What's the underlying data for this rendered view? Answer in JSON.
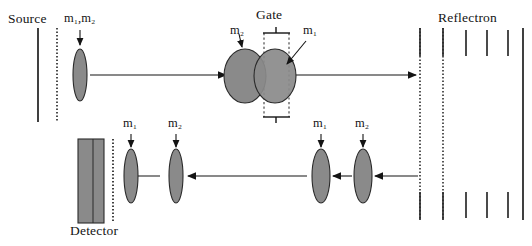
{
  "figure": {
    "type": "diagram",
    "background_color": "#ffffff",
    "ink_color": "#141414",
    "packet_fill": "#8a8a8a",
    "packet_stroke": "#2a2a2a",
    "detector_fill": "#8a8a8a",
    "width": 532,
    "height": 246
  },
  "labels": {
    "source": "Source",
    "gate": "Gate",
    "reflectron": "Reflectron",
    "detector": "Detector",
    "source_packet": "m₁,m₂",
    "gate_left_packet": "m₂",
    "gate_right_packet": "m₁",
    "return_near_packet": "m₁",
    "return_far_packet": "m₂",
    "drift_left_packet": "m₁",
    "drift_right_packet": "m₂"
  },
  "mass_tokens": {
    "m1": {
      "base": "m",
      "sub": "1"
    },
    "m2": {
      "base": "m",
      "sub": "2"
    },
    "m1m2": {
      "base": "m",
      "sub": "1",
      "sep": ",",
      "base2": "m",
      "sub2": "2"
    }
  },
  "elements": {
    "source_plate_solid": {
      "x": 38,
      "y1": 28,
      "y2": 122
    },
    "source_grid_dotted": {
      "x": 57,
      "y1": 28,
      "y2": 122
    },
    "detector_plate": {
      "x": 78,
      "y": 139,
      "width": 26,
      "height": 84
    },
    "detector_grid_dotted": {
      "x": 113,
      "y1": 139,
      "y2": 223
    },
    "reflectron_front_grid": {
      "x": 420,
      "y1": 28,
      "y2": 220
    },
    "reflectron_second_grid": {
      "x": 443,
      "y1": 28,
      "y2": 220
    },
    "reflectron_rings": [
      466,
      487,
      508
    ],
    "reflectron_back_plate": {
      "x": 523,
      "y1": 28,
      "y2": 220
    },
    "gate_bracket_top_y": 33,
    "gate_bracket_bottom_y": 117,
    "gate_left_x": 264,
    "gate_right_x": 289
  },
  "ion_packets": [
    {
      "name": "source-packet",
      "cx": 80,
      "cy": 75,
      "rx": 7,
      "ry": 26,
      "label": "m₁,m₂"
    },
    {
      "name": "gate-packet-m2",
      "cx": 245,
      "cy": 76,
      "rx": 21,
      "ry": 27,
      "label": "m₂"
    },
    {
      "name": "gate-packet-m1",
      "cx": 275,
      "cy": 76,
      "rx": 21,
      "ry": 27,
      "label": "m₁"
    },
    {
      "name": "return-packet-m1",
      "cx": 131,
      "cy": 176,
      "rx": 7,
      "ry": 27,
      "label": "m₁"
    },
    {
      "name": "return-packet-m2",
      "cx": 176,
      "cy": 176,
      "rx": 7,
      "ry": 27,
      "label": "m₂"
    },
    {
      "name": "drift-packet-m1",
      "cx": 321,
      "cy": 176,
      "rx": 9,
      "ry": 27,
      "label": "m₁"
    },
    {
      "name": "drift-packet-m2",
      "cx": 363,
      "cy": 176,
      "rx": 9,
      "ry": 27,
      "label": "m₂"
    }
  ],
  "flight_paths": [
    {
      "name": "source-to-gate",
      "x1": 90,
      "x2": 228,
      "y": 75,
      "direction": "right"
    },
    {
      "name": "gate-to-reflectron",
      "x1": 296,
      "x2": 418,
      "y": 75,
      "direction": "right"
    },
    {
      "name": "return-to-detector",
      "x1": 160,
      "x2": 124,
      "y": 176,
      "direction": "left"
    },
    {
      "name": "between-return-packets",
      "x1": 307,
      "x2": 186,
      "y": 176,
      "direction": "left"
    },
    {
      "name": "between-drift-packets",
      "x1": 352,
      "x2": 331,
      "y": 176,
      "direction": "left"
    },
    {
      "name": "reflectron-to-drift",
      "x1": 418,
      "x2": 373,
      "y": 176,
      "direction": "left"
    }
  ],
  "pointer_arrows": [
    {
      "name": "pointer-source-packet",
      "x1": 80,
      "y1": 30,
      "x2": 80,
      "y2": 47
    },
    {
      "name": "pointer-gate-m2",
      "x1": 239,
      "y1": 34,
      "x2": 243,
      "y2": 50
    },
    {
      "name": "pointer-gate-m1",
      "x1": 304,
      "y1": 42,
      "x2": 285,
      "y2": 66
    },
    {
      "name": "pointer-return-m1",
      "x1": 131,
      "y1": 133,
      "x2": 131,
      "y2": 150
    },
    {
      "name": "pointer-return-m2",
      "x1": 176,
      "y1": 133,
      "x2": 176,
      "y2": 150
    },
    {
      "name": "pointer-drift-m1",
      "x1": 321,
      "y1": 133,
      "x2": 321,
      "y2": 150
    },
    {
      "name": "pointer-drift-m2",
      "x1": 363,
      "y1": 133,
      "x2": 363,
      "y2": 150
    }
  ]
}
